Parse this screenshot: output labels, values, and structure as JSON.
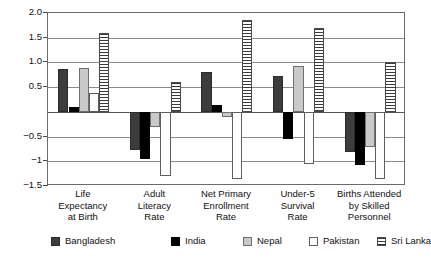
{
  "chart_data": {
    "type": "bar",
    "title": "",
    "subtitle": "",
    "xlabel": "",
    "ylabel": "",
    "ylim": [
      -1.5,
      2.0
    ],
    "ytick_values": [
      2.0,
      1.5,
      1.0,
      0.5,
      -0.5,
      -1,
      -1.5
    ],
    "ytick_labels": [
      "2.0",
      "1.5",
      "1.0",
      "0.5",
      "−0.5",
      "−1",
      "−1.5"
    ],
    "grid": true,
    "legend_position": "bottom",
    "categories": [
      "Life Expectancy at Birth",
      "Adult Literacy Rate",
      "Net Primary Enrollment Rate",
      "Under-5 Survival Rate",
      "Births Attended by Skilled Personnel"
    ],
    "category_label_lines": [
      [
        "Life",
        "Expectancy",
        "at Birth"
      ],
      [
        "Adult",
        "Literacy",
        "Rate"
      ],
      [
        "Net Primary",
        "Enrollment",
        "Rate"
      ],
      [
        "Under-5",
        "Survival",
        "Rate"
      ],
      [
        "Births Attended",
        "by Skilled",
        "Personnel"
      ]
    ],
    "series": [
      {
        "name": "Bangladesh",
        "key": "bangladesh",
        "color": "#3c3c3c",
        "pattern": "solid-dark-gray",
        "values": [
          0.87,
          -0.78,
          0.8,
          0.72,
          -0.82
        ]
      },
      {
        "name": "India",
        "key": "india",
        "color": "#000000",
        "pattern": "solid-black",
        "values": [
          0.1,
          -0.95,
          0.14,
          -0.55,
          -1.08
        ]
      },
      {
        "name": "Nepal",
        "key": "nepal",
        "color": "#c9c9c9",
        "pattern": "solid-light-gray",
        "values": [
          0.88,
          -0.3,
          -0.1,
          0.92,
          -0.72
        ]
      },
      {
        "name": "Pakistan",
        "key": "pakistan",
        "color": "#fdfdfd",
        "pattern": "solid-white",
        "values": [
          0.38,
          -1.3,
          -1.35,
          -1.05,
          -1.35
        ]
      },
      {
        "name": "Sri Lanka",
        "key": "srilanka",
        "color": "#ffffff",
        "pattern": "horizontal-stripes",
        "values": [
          1.6,
          0.6,
          1.85,
          1.7,
          1.0
        ]
      }
    ]
  },
  "legend": {
    "items": [
      {
        "label": "Bangladesh",
        "key": "bangladesh"
      },
      {
        "label": "India",
        "key": "india"
      },
      {
        "label": "Nepal",
        "key": "nepal"
      },
      {
        "label": "Pakistan",
        "key": "pakistan"
      },
      {
        "label": "Sri Lanka",
        "key": "srilanka"
      }
    ]
  }
}
